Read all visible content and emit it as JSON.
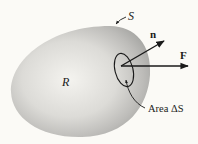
{
  "diagram": {
    "region_label": "R",
    "surface_label": "S",
    "normal_label": "n",
    "force_label": "F",
    "area_label": "Area ΔS",
    "colors": {
      "background": "#fbfaf6",
      "region_light": "#f4f3ef",
      "region_dark": "#a9a9a6",
      "ink": "#1a1a1a"
    }
  }
}
